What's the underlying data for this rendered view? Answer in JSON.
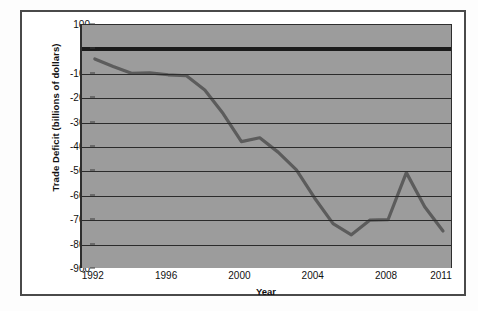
{
  "chart_data": {
    "type": "line",
    "title": "",
    "xlabel": "Year",
    "ylabel": "Trade Deficit (billions of dollars)",
    "xlim": [
      1991.3,
      2011.6
    ],
    "ylim": [
      -900,
      100
    ],
    "ytick_step": 100,
    "grid": true,
    "legend": "none",
    "line_color": "#5c5c5c",
    "plot_background": "#9c9c9c",
    "gridline_color": "#2b2b2b",
    "zero_line_emphasized": true,
    "yticks": [
      100,
      0,
      -100,
      -200,
      -300,
      -400,
      -500,
      -600,
      -700,
      -800,
      -900
    ],
    "ytick_labels": [
      "100",
      "0",
      "-100",
      "-200",
      "-300",
      "-400",
      "-500",
      "-600",
      "-700",
      "-800",
      "-900"
    ],
    "xticks": [
      1992,
      1996,
      2000,
      2004,
      2008,
      2011
    ],
    "xtick_labels": [
      "1992",
      "1996",
      "2000",
      "2004",
      "2008",
      "2011"
    ],
    "x": [
      1992,
      1993,
      1994,
      1995,
      1996,
      1997,
      1998,
      1999,
      2000,
      2001,
      2002,
      2003,
      2004,
      2005,
      2006,
      2007,
      2008,
      2009,
      2010,
      2011
    ],
    "values": [
      -39,
      -70,
      -98,
      -96,
      -104,
      -108,
      -166,
      -263,
      -378,
      -362,
      -421,
      -494,
      -610,
      -714,
      -760,
      -700,
      -698,
      -505,
      -645,
      -744
    ],
    "series": [
      {
        "name": "Trade Deficit",
        "values": [
          -39,
          -70,
          -98,
          -96,
          -104,
          -108,
          -166,
          -263,
          -378,
          -362,
          -421,
          -494,
          -610,
          -714,
          -760,
          -700,
          -698,
          -505,
          -645,
          -744
        ]
      }
    ]
  }
}
